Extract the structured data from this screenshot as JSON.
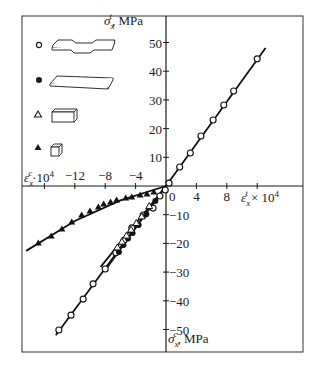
{
  "chart_data": {
    "type": "scatter",
    "title": "",
    "xlabel_tension": "ε_x^t × 10^4",
    "xlabel_compression": "ε_x^c·10^4",
    "ylabel_tension": "σ_x^t, MPa",
    "ylabel_compression": "σ_x^c, MPa",
    "xlim": [
      -18,
      17
    ],
    "ylim": [
      -58,
      59
    ],
    "x_ticks": [
      -16,
      -12,
      -8,
      -4,
      0,
      4,
      8,
      12
    ],
    "x_tick_labels": [
      "",
      "−12",
      "−8",
      "−4",
      "0",
      "4",
      "8",
      ""
    ],
    "y_ticks": [
      -50,
      -40,
      -30,
      -20,
      -10,
      10,
      20,
      30,
      40,
      50
    ],
    "y_tick_labels": [
      "−50",
      "−40",
      "−30",
      "−20",
      "−10",
      "10",
      "20",
      "30",
      "40",
      "50"
    ],
    "grid": false,
    "legend_position": "upper left",
    "legend": [
      {
        "marker": "open-circle",
        "specimen": "dogbone"
      },
      {
        "marker": "filled-circle",
        "specimen": "flat-plate"
      },
      {
        "marker": "open-triangle",
        "specimen": "rectangular-block"
      },
      {
        "marker": "filled-triangle",
        "specimen": "cube"
      }
    ],
    "series": [
      {
        "name": "tension (open circle)",
        "marker": "open-circle",
        "x": [
          0.4,
          1.8,
          3.2,
          4.6,
          6.2,
          7.6,
          8.9,
          12.0
        ],
        "y": [
          1.0,
          6.6,
          11.5,
          17.4,
          23.0,
          28.2,
          33.1,
          44.3
        ],
        "fit_line": {
          "x": [
            0,
            13.1
          ],
          "y": [
            0,
            48.1
          ]
        }
      },
      {
        "name": "compression (open circle)",
        "marker": "open-circle",
        "x": [
          -14.1,
          -12.5,
          -10.9,
          -9.6,
          -8.0,
          -6.6,
          -5.5,
          -4.5,
          -3.0,
          -1.7,
          -0.8,
          -0.1
        ],
        "y": [
          -50.2,
          -45.0,
          -39.4,
          -34.1,
          -28.9,
          -23.3,
          -18.8,
          -14.6,
          -10.1,
          -7.7,
          -3.5,
          -1.4
        ],
        "fit_line": {
          "x": [
            -14.5,
            0
          ],
          "y": [
            -52.0,
            0
          ]
        }
      },
      {
        "name": "compression (filled circle)",
        "marker": "filled-circle",
        "x": [
          -6.2,
          -5.6,
          -5.0,
          -4.4,
          -3.6,
          -2.6,
          -1.4
        ],
        "y": [
          -23.0,
          -20.6,
          -18.3,
          -16.4,
          -13.6,
          -9.8,
          -5.2
        ]
      },
      {
        "name": "compression (open triangle)",
        "marker": "open-triangle",
        "x": [
          -6.4,
          -5.8,
          -5.2,
          -4.6,
          -3.9,
          -3.2,
          -2.2
        ],
        "y": [
          -21.4,
          -19.4,
          -17.3,
          -15.2,
          -12.9,
          -10.6,
          -7.0
        ],
        "fit_line": {
          "x": [
            -8.6,
            0
          ],
          "y": [
            -28.2,
            0
          ]
        }
      },
      {
        "name": "compression (filled triangle)",
        "marker": "filled-triangle",
        "x": [
          -16.8,
          -15.1,
          -13.7,
          -12.4,
          -11.1,
          -10.0,
          -8.9,
          -8.2,
          -7.3,
          -6.5,
          -5.3,
          -4.5,
          -3.4,
          -2.5,
          -1.6
        ],
        "y": [
          -19.9,
          -17.4,
          -15.0,
          -12.5,
          -10.1,
          -8.7,
          -7.3,
          -6.3,
          -5.6,
          -4.9,
          -4.2,
          -3.8,
          -3.1,
          -2.8,
          -2.1
        ],
        "fit_line": {
          "x": [
            -18.4,
            -12,
            -6,
            0
          ],
          "y": [
            -22.6,
            -12.2,
            -5.0,
            0
          ]
        }
      }
    ]
  },
  "labels": {
    "y_top_axis": "σ",
    "y_top_sub": "x",
    "y_top_sup": "t",
    "y_top_unit": ", MPa",
    "y_bot_axis": "σ",
    "y_bot_sub": "x",
    "y_bot_sup": "c",
    "y_bot_unit": ", MPa",
    "x_right_axis": "ε",
    "x_right_sub": "x",
    "x_right_sup": "t",
    "x_right_unit": " × 10",
    "x_right_exp": "4",
    "x_left_axis": "ε",
    "x_left_sub": "x",
    "x_left_sup": "c",
    "x_left_unit": "·10",
    "x_left_exp": "4"
  }
}
